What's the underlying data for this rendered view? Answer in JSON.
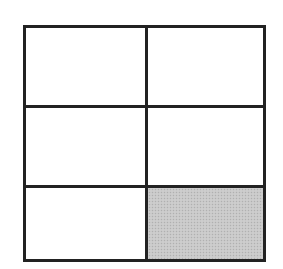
{
  "diagram": {
    "type": "grid",
    "rows": 3,
    "columns": 2,
    "border_color": "#222222",
    "cells": [
      {
        "row": 1,
        "col": 1,
        "shaded": false
      },
      {
        "row": 1,
        "col": 2,
        "shaded": false
      },
      {
        "row": 2,
        "col": 1,
        "shaded": false
      },
      {
        "row": 2,
        "col": 2,
        "shaded": false
      },
      {
        "row": 3,
        "col": 1,
        "shaded": false
      },
      {
        "row": 3,
        "col": 2,
        "shaded": true,
        "fill_color": "#c8c8c8"
      }
    ],
    "shaded_count": 1,
    "total_cells": 6
  }
}
